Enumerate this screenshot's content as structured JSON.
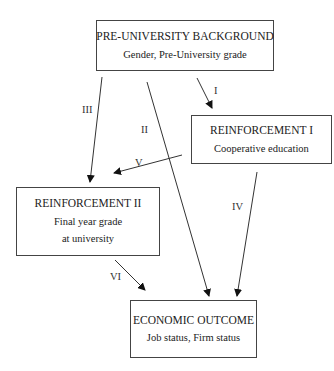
{
  "diagram": {
    "nodes": {
      "background": {
        "title": "PRE-UNIVERSITY BACKGROUND",
        "lines": [
          "Gender, Pre-University grade"
        ]
      },
      "reinforcement1": {
        "title": "REINFORCEMENT I",
        "lines": [
          "Cooperative education"
        ]
      },
      "reinforcement2": {
        "title": "REINFORCEMENT II",
        "lines": [
          "Final year grade",
          "at university"
        ]
      },
      "outcome": {
        "title": "ECONOMIC OUTCOME",
        "lines": [
          "Job status, Firm status"
        ]
      }
    },
    "edges": [
      {
        "label": "I",
        "from": "background",
        "to": "reinforcement1"
      },
      {
        "label": "II",
        "from": "background",
        "to": "outcome"
      },
      {
        "label": "III",
        "from": "background",
        "to": "reinforcement2"
      },
      {
        "label": "IV",
        "from": "reinforcement1",
        "to": "outcome"
      },
      {
        "label": "V",
        "from": "reinforcement1",
        "to": "reinforcement2"
      },
      {
        "label": "VI",
        "from": "reinforcement2",
        "to": "outcome"
      }
    ]
  }
}
